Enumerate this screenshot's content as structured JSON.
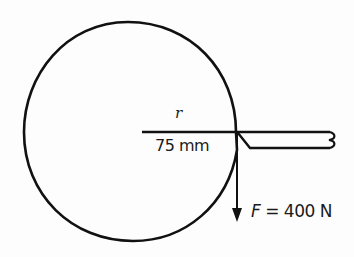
{
  "figure": {
    "type": "mechanics-diagram",
    "labels": {
      "radius_symbol": "r",
      "radius_value": "75 mm",
      "force_symbol": "F",
      "force_equals": " = ",
      "force_value": "400 N"
    },
    "colors": {
      "stroke": "#111111",
      "background": "#fdfdfd"
    }
  }
}
